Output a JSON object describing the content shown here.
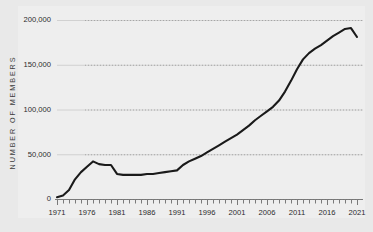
{
  "chart_data": {
    "type": "line",
    "title": "",
    "subtitle": "",
    "xlabel": "",
    "ylabel": "NUMBER OF MEMBERS",
    "xlim": [
      1971,
      2021
    ],
    "ylim": [
      0,
      200000
    ],
    "grid": true,
    "legend": null,
    "y_ticks": [
      0,
      50000,
      100000,
      150000,
      200000
    ],
    "y_tick_labels": [
      "0",
      "50,000",
      "100,000",
      "150,000",
      "200,000"
    ],
    "x_ticks": [
      1971,
      1976,
      1981,
      1986,
      1991,
      1996,
      2001,
      2006,
      2011,
      2016,
      2021
    ],
    "x_tick_labels": [
      "1971",
      "1976",
      "1981",
      "1986",
      "1991",
      "1996",
      "2001",
      "2006",
      "2011",
      "2016",
      "2021"
    ],
    "x_minor_tick_interval": 1,
    "line_color": "#1a1a1a",
    "line_width": 2.1,
    "panel_background": "#eeeeee",
    "figure_background": "#e9e9e9",
    "gridline_color": "#bdbdbd",
    "series": [
      {
        "name": "Number of Members",
        "x": [
          1971,
          1972,
          1973,
          1974,
          1975,
          1976,
          1977,
          1978,
          1979,
          1980,
          1981,
          1982,
          1983,
          1984,
          1985,
          1986,
          1987,
          1988,
          1989,
          1990,
          1991,
          1992,
          1993,
          1994,
          1995,
          1996,
          1997,
          1998,
          1999,
          2000,
          2001,
          2002,
          2003,
          2004,
          2005,
          2006,
          2007,
          2008,
          2009,
          2010,
          2011,
          2012,
          2013,
          2014,
          2015,
          2016,
          2017,
          2018,
          2019,
          2020,
          2021
        ],
        "values": [
          2000,
          4000,
          10000,
          22000,
          30000,
          36000,
          42000,
          39000,
          38000,
          38000,
          28000,
          27000,
          27000,
          27000,
          27000,
          28000,
          28000,
          29000,
          30000,
          31000,
          32000,
          38000,
          42000,
          45000,
          48000,
          52000,
          56000,
          60000,
          64000,
          68000,
          72000,
          77000,
          82000,
          88000,
          93000,
          98000,
          103000,
          110000,
          120000,
          132000,
          145000,
          156000,
          163000,
          168000,
          172000,
          177000,
          182000,
          186000,
          190000,
          191000,
          181000
        ]
      }
    ]
  }
}
